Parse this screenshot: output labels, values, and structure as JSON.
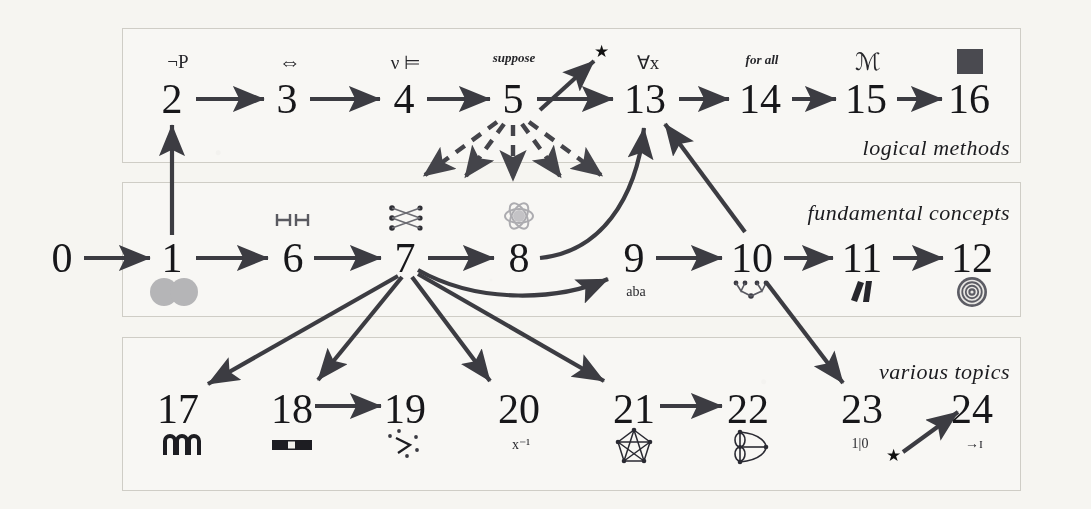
{
  "diagram": {
    "title_rows": [
      {
        "id": "logical-methods",
        "label": "logical  methods",
        "x": 1010,
        "y": 148
      },
      {
        "id": "fundamental-concepts",
        "label": "fundamental  concepts",
        "x": 1010,
        "y": 213
      },
      {
        "id": "various-topics",
        "label": "various  topics",
        "x": 1010,
        "y": 372
      }
    ],
    "panels": [
      {
        "id": "panel-logical-methods",
        "x": 122,
        "y": 28,
        "w": 897,
        "h": 133
      },
      {
        "id": "panel-fundamental-concepts",
        "x": 122,
        "y": 182,
        "w": 897,
        "h": 133
      },
      {
        "id": "panel-various-topics",
        "x": 122,
        "y": 337,
        "w": 897,
        "h": 152
      }
    ],
    "nodes": [
      {
        "id": "n0",
        "label": "0",
        "x": 62,
        "y": 258,
        "top": "",
        "bottom": "",
        "icon": "none"
      },
      {
        "id": "n1",
        "label": "1",
        "x": 172,
        "y": 258,
        "top": "",
        "bottom": "",
        "icon": "venn-two-circles"
      },
      {
        "id": "n2",
        "label": "2",
        "x": 172,
        "y": 99,
        "top": "¬P",
        "bottom": "",
        "icon": "none"
      },
      {
        "id": "n3",
        "label": "3",
        "x": 287,
        "y": 99,
        "top": "⇔",
        "bottom": "",
        "icon": "none"
      },
      {
        "id": "n4",
        "label": "4",
        "x": 404,
        "y": 99,
        "top": "ν ⊨",
        "bottom": "",
        "icon": "none"
      },
      {
        "id": "n5",
        "label": "5",
        "x": 513,
        "y": 99,
        "top": "suppose",
        "top_style": "italic",
        "bottom": "",
        "icon": "none"
      },
      {
        "id": "n6",
        "label": "6",
        "x": 293,
        "y": 258,
        "top": "",
        "bottom": "",
        "icon": "turnstile-marks"
      },
      {
        "id": "n7",
        "label": "7",
        "x": 405,
        "y": 258,
        "top": "",
        "bottom": "",
        "icon": "bipartite-dots"
      },
      {
        "id": "n8",
        "label": "8",
        "x": 519,
        "y": 258,
        "top": "",
        "bottom": "",
        "icon": "atom-orbits"
      },
      {
        "id": "n9",
        "label": "9",
        "x": 634,
        "y": 258,
        "top": "",
        "bottom": "aba",
        "icon": "none"
      },
      {
        "id": "n10",
        "label": "10",
        "x": 752,
        "y": 258,
        "top": "",
        "bottom": "",
        "icon": "tree-graph"
      },
      {
        "id": "n11",
        "label": "11",
        "x": 862,
        "y": 258,
        "top": "",
        "bottom": "",
        "icon": "slanted-bars"
      },
      {
        "id": "n12",
        "label": "12",
        "x": 972,
        "y": 258,
        "top": "",
        "bottom": "",
        "icon": "concentric-circles"
      },
      {
        "id": "n13",
        "label": "13",
        "x": 645,
        "y": 99,
        "top": "∀x",
        "bottom": "",
        "icon": "none"
      },
      {
        "id": "n14",
        "label": "14",
        "x": 760,
        "y": 99,
        "top": "for all",
        "top_style": "italic",
        "bottom": "",
        "icon": "none"
      },
      {
        "id": "n15",
        "label": "15",
        "x": 866,
        "y": 99,
        "top": "ℳ",
        "bottom": "",
        "icon": "none"
      },
      {
        "id": "n16",
        "label": "16",
        "x": 969,
        "y": 99,
        "top": "",
        "bottom": "",
        "icon": "filled-square"
      },
      {
        "id": "n17",
        "label": "17",
        "x": 178,
        "y": 409,
        "top": "",
        "bottom": "",
        "icon": "arch-columns"
      },
      {
        "id": "n18",
        "label": "18",
        "x": 292,
        "y": 409,
        "top": "",
        "bottom": "",
        "icon": "domino-bar"
      },
      {
        "id": "n19",
        "label": "19",
        "x": 405,
        "y": 409,
        "top": "",
        "bottom": "",
        "icon": "scattered-path"
      },
      {
        "id": "n20",
        "label": "20",
        "x": 519,
        "y": 409,
        "top": "",
        "bottom": "x⁻¹",
        "icon": "none"
      },
      {
        "id": "n21",
        "label": "21",
        "x": 634,
        "y": 409,
        "top": "",
        "bottom": "",
        "icon": "pentagram-k5"
      },
      {
        "id": "n22",
        "label": "22",
        "x": 748,
        "y": 409,
        "top": "",
        "bottom": "",
        "icon": "multigraph-lens"
      },
      {
        "id": "n23",
        "label": "23",
        "x": 862,
        "y": 409,
        "top": "",
        "bottom": "1|0",
        "icon": "none"
      },
      {
        "id": "n24",
        "label": "24",
        "x": 972,
        "y": 409,
        "top": "",
        "bottom": "→ɪ",
        "icon": "none"
      }
    ],
    "edges": [
      {
        "from": "0",
        "to": "1",
        "kind": "solid-straight"
      },
      {
        "from": "1",
        "to": "2",
        "kind": "solid-straight-up"
      },
      {
        "from": "2",
        "to": "3",
        "kind": "solid-straight"
      },
      {
        "from": "3",
        "to": "4",
        "kind": "solid-straight"
      },
      {
        "from": "4",
        "to": "5",
        "kind": "solid-straight"
      },
      {
        "from": "5",
        "to": "13",
        "kind": "solid-straight"
      },
      {
        "from": "5",
        "to": "star",
        "kind": "solid-diagonal-up"
      },
      {
        "from": "13",
        "to": "14",
        "kind": "solid-straight"
      },
      {
        "from": "14",
        "to": "15",
        "kind": "solid-straight"
      },
      {
        "from": "15",
        "to": "16",
        "kind": "solid-straight"
      },
      {
        "from": "1",
        "to": "6",
        "kind": "solid-straight"
      },
      {
        "from": "6",
        "to": "7",
        "kind": "solid-straight"
      },
      {
        "from": "7",
        "to": "8",
        "kind": "solid-straight"
      },
      {
        "from": "7",
        "to": "9",
        "kind": "solid-curved"
      },
      {
        "from": "8",
        "to": "13",
        "kind": "solid-curved-up"
      },
      {
        "from": "9",
        "to": "10",
        "kind": "solid-straight"
      },
      {
        "from": "10",
        "to": "11",
        "kind": "solid-straight"
      },
      {
        "from": "11",
        "to": "12",
        "kind": "solid-straight"
      },
      {
        "from": "10",
        "to": "13",
        "kind": "solid-diagonal-up"
      },
      {
        "from": "5",
        "to": "fan-1",
        "kind": "dashed-fan"
      },
      {
        "from": "5",
        "to": "fan-2",
        "kind": "dashed-fan"
      },
      {
        "from": "5",
        "to": "fan-3",
        "kind": "dashed-fan"
      },
      {
        "from": "5",
        "to": "fan-4",
        "kind": "dashed-fan"
      },
      {
        "from": "5",
        "to": "fan-5",
        "kind": "dashed-fan"
      },
      {
        "from": "7",
        "to": "17",
        "kind": "solid-diagonal-down"
      },
      {
        "from": "7",
        "to": "18",
        "kind": "solid-diagonal-down"
      },
      {
        "from": "7",
        "to": "20",
        "kind": "solid-diagonal-down"
      },
      {
        "from": "7",
        "to": "21",
        "kind": "solid-diagonal-down"
      },
      {
        "from": "10",
        "to": "23",
        "kind": "solid-diagonal-down"
      },
      {
        "from": "18",
        "to": "19",
        "kind": "solid-straight"
      },
      {
        "from": "21",
        "to": "22",
        "kind": "solid-straight"
      },
      {
        "from": "star2",
        "to": "24",
        "kind": "solid-diagonal-up"
      }
    ],
    "markers": [
      {
        "id": "star-top",
        "glyph": "★",
        "x": 601,
        "y": 51
      },
      {
        "id": "star-bottom",
        "glyph": "★",
        "x": 893,
        "y": 455
      }
    ],
    "colors": {
      "ink": "#17171a",
      "edge": "#3c3c42",
      "panel_border": "#cfcdc6",
      "page_bg": "#f6f5f1",
      "icon_gray": "#8d8d92"
    }
  }
}
